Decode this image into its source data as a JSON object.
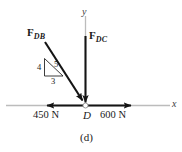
{
  "figure": {
    "caption": "(d)",
    "node_label": "D",
    "axes": {
      "x_label": "x",
      "y_label": "y",
      "axis_color": "#b8b8b8"
    },
    "vectors": [
      {
        "id": "F_DB",
        "symbol": "F",
        "subscript": "DB",
        "color": "#141414",
        "direction": "down-right diagonal into D"
      },
      {
        "id": "F_DC",
        "symbol": "F",
        "subscript": "DC",
        "color": "#141414",
        "direction": "straight down into D"
      }
    ],
    "slope_triangle": {
      "vertical": "4",
      "hypotenuse": "5",
      "horizontal": "3"
    },
    "forces": [
      {
        "id": "left-force",
        "magnitude": "450 N",
        "direction": "left"
      },
      {
        "id": "right-force",
        "magnitude": "600 N",
        "direction": "right"
      }
    ]
  }
}
